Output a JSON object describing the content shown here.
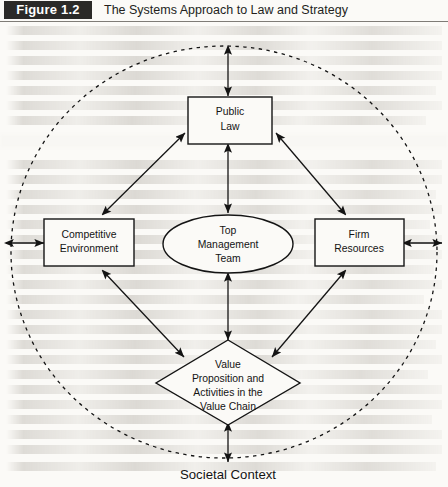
{
  "header": {
    "badge": "Figure 1.2",
    "title": "The Systems Approach to Law and Strategy"
  },
  "diagram": {
    "type": "systems-diagram",
    "outer_boundary": {
      "name": "societal-context",
      "shape": "circle",
      "stroke": "dashed",
      "label": "Societal Context"
    },
    "nodes": [
      {
        "id": "public-law",
        "shape": "rectangle",
        "lines": [
          "Public",
          "Law"
        ],
        "position": "top"
      },
      {
        "id": "competitive-environment",
        "shape": "rectangle",
        "lines": [
          "Competitive",
          "Environment"
        ],
        "position": "left"
      },
      {
        "id": "firm-resources",
        "shape": "rectangle",
        "lines": [
          "Firm",
          "Resources"
        ],
        "position": "right"
      },
      {
        "id": "top-management-team",
        "shape": "ellipse",
        "lines": [
          "Top",
          "Management",
          "Team"
        ],
        "position": "center"
      },
      {
        "id": "value-proposition",
        "shape": "diamond",
        "lines": [
          "Value",
          "Proposition and",
          "Activities in the",
          "Value Chain"
        ],
        "position": "bottom"
      }
    ],
    "connections": [
      {
        "from": "competitive-environment",
        "to": "public-law",
        "arrows": "double"
      },
      {
        "from": "firm-resources",
        "to": "public-law",
        "arrows": "double"
      },
      {
        "from": "competitive-environment",
        "to": "value-proposition",
        "arrows": "double"
      },
      {
        "from": "firm-resources",
        "to": "value-proposition",
        "arrows": "double"
      },
      {
        "from": "public-law",
        "to": "top-management-team",
        "arrows": "double"
      },
      {
        "from": "top-management-team",
        "to": "value-proposition",
        "arrows": "double"
      },
      {
        "from": "societal-context",
        "to": "public-law",
        "arrows": "double"
      },
      {
        "from": "societal-context",
        "to": "competitive-environment",
        "arrows": "double"
      },
      {
        "from": "societal-context",
        "to": "firm-resources",
        "arrows": "double"
      },
      {
        "from": "societal-context",
        "to": "value-proposition",
        "arrows": "double"
      }
    ],
    "colors": {
      "stroke": "#141414",
      "text": "#141414",
      "page_background": "#fbfaf7",
      "badge_background": "#2b2a28",
      "badge_text": "#ffffff"
    }
  }
}
